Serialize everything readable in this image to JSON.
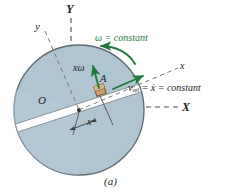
{
  "figure": {
    "caption": "(a)",
    "type": "engineering-mechanics-diagram"
  },
  "colors": {
    "disc_fill": "#b0c4d2",
    "disc_edge": "#5d6a72",
    "slot_fill": "#ffffff",
    "arrow_green": "#1f7a3d",
    "block_fill": "#c9a06a",
    "block_edge": "#6b5230",
    "text": "#231f1e",
    "dash": "#5a5a5a"
  },
  "labels": {
    "axis_Y": "Y",
    "axis_X": "X",
    "axis_y_rotating": "y",
    "axis_x_rotating": "x",
    "origin": "O",
    "point_A": "A",
    "omega_constant": "ω = constant",
    "x_omega": "xω",
    "v_rel": "v",
    "v_rel_sub": "rel",
    "v_rel_rest": " = ẋ = constant",
    "x_dimension": "x"
  },
  "geometry": {
    "disc_center_x": 79,
    "disc_center_y": 110,
    "disc_radius": 65,
    "slot_angle_deg": -18,
    "block_position_x": 100,
    "block_position_y": 90
  }
}
